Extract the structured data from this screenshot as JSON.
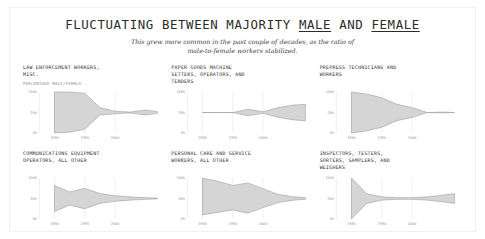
{
  "header": {
    "title_part1": "FLUCTUATING BETWEEN MAJORITY ",
    "title_male": "MALE",
    "title_and": " AND ",
    "title_female": "FEMALE",
    "title_full": "FLUCTUATING BETWEEN MAJORITY MALE AND FEMALE",
    "subtitle": "This grew more common in the past couple of decades, as the ratio of male-to-female workers stabilized."
  },
  "chart_data": {
    "type": "area",
    "title": "FLUCTUATING BETWEEN MAJORITY MALE AND FEMALE",
    "subtitle": "This grew more common in the past couple of decades, as the ratio of male-to-female workers stabilized.",
    "ylabel": "PERCENTAGE MALE/FEMALE",
    "xlabel": "",
    "ylim": [
      0,
      100
    ],
    "xlim": [
      1975,
      2015
    ],
    "ytick_labels": [
      "100%",
      "50%",
      "0%"
    ],
    "ytick_values": [
      100,
      50,
      0
    ],
    "xtick_labels": [
      "1980",
      "1990",
      "2000"
    ],
    "xtick_values": [
      1980,
      1990,
      2000
    ],
    "grid": "vertical",
    "legend": "none",
    "series_note": "Each panel shows a band spanning the male and female share of workers; the band narrows as the ratio stabilizes near 50/50.",
    "panels": [
      {
        "label": "LAW ENFORCEMENT WORKERS,\nMISC.",
        "axis_note": "PERCENTAGE MALE/FEMALE",
        "x": [
          1980,
          1985,
          1990,
          1995,
          2000,
          2005,
          2010,
          2014
        ],
        "upper": [
          100,
          100,
          97,
          62,
          53,
          51,
          56,
          52
        ],
        "lower": [
          0,
          2,
          9,
          44,
          47,
          49,
          44,
          48
        ]
      },
      {
        "label": "PAPER GOODS MACHINE\nSETTERS, OPERATORS, AND\nTENDERS",
        "axis_note": "",
        "x": [
          1980,
          1985,
          1990,
          1995,
          2000,
          2005,
          2010,
          2014
        ],
        "upper": [
          50,
          50,
          50,
          58,
          52,
          62,
          68,
          70
        ],
        "lower": [
          50,
          50,
          50,
          42,
          48,
          38,
          32,
          30
        ]
      },
      {
        "label": "PREPRESS TECHNICIANS AND\nWORKERS",
        "axis_note": "",
        "x": [
          1980,
          1985,
          1990,
          1995,
          2000,
          2005,
          2010,
          2014
        ],
        "upper": [
          100,
          95,
          86,
          70,
          62,
          50,
          51,
          50
        ],
        "lower": [
          0,
          5,
          14,
          30,
          38,
          50,
          49,
          50
        ]
      },
      {
        "label": "COMMUNICATIONS EQUIPMENT\nOPERATORS, ALL OTHER",
        "axis_note": "",
        "x": [
          1980,
          1985,
          1990,
          1995,
          2000,
          2005,
          2010,
          2014
        ],
        "upper": [
          82,
          66,
          75,
          62,
          57,
          54,
          52,
          51
        ],
        "lower": [
          18,
          34,
          25,
          38,
          43,
          46,
          48,
          49
        ]
      },
      {
        "label": "PERSONAL CARE AND SERVICE\nWORKERS, ALL OTHER",
        "axis_note": "",
        "x": [
          1980,
          1985,
          1990,
          1995,
          2000,
          2005,
          2010,
          2014
        ],
        "upper": [
          100,
          92,
          82,
          88,
          74,
          60,
          54,
          52
        ],
        "lower": [
          10,
          16,
          22,
          14,
          28,
          40,
          46,
          48
        ]
      },
      {
        "label": "INSPECTORS, TESTERS,\nSORTERS, SAMPLERS, AND\nWEIGHERS",
        "axis_note": "",
        "x": [
          1980,
          1985,
          1990,
          1995,
          2000,
          2005,
          2010,
          2014
        ],
        "upper": [
          100,
          62,
          54,
          52,
          52,
          54,
          58,
          62
        ],
        "lower": [
          0,
          38,
          46,
          48,
          48,
          46,
          42,
          38
        ]
      }
    ]
  },
  "colors": {
    "band_fill": "#d5d5d5",
    "band_stroke": "#8f8f8f",
    "grid": "#e6e6e6",
    "axis_text": "#9a9a9a",
    "title_text": "#2b2b2b",
    "frame": "#f0f0f0",
    "background": "#ffffff"
  }
}
